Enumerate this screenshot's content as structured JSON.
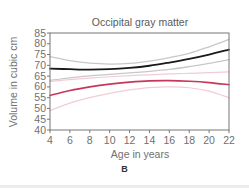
{
  "panel_label": "B",
  "chart_data": {
    "type": "line",
    "title": "Occipital gray matter",
    "xlabel": "Age in years",
    "ylabel": "Volume in cubic cm",
    "xlim": [
      4,
      22
    ],
    "ylim": [
      40,
      85
    ],
    "xticks": [
      4,
      6,
      8,
      10,
      12,
      14,
      16,
      18,
      20,
      22
    ],
    "yticks": [
      40,
      45,
      50,
      55,
      60,
      65,
      70,
      75,
      80,
      85
    ],
    "grid": false,
    "legend": null,
    "x": [
      4,
      6,
      8,
      10,
      12,
      14,
      16,
      18,
      20,
      22
    ],
    "series": [
      {
        "name": "Male mean",
        "color": "#1a1a1a",
        "width": 1.8,
        "values": [
          68.5,
          68.2,
          68.0,
          68.2,
          68.8,
          69.8,
          71.3,
          73.0,
          75.0,
          77.3
        ]
      },
      {
        "name": "Male upper CI",
        "color": "#c8c8c8",
        "width": 1.3,
        "values": [
          74.0,
          72.2,
          71.0,
          70.6,
          70.9,
          72.0,
          73.6,
          75.6,
          78.6,
          82.0
        ]
      },
      {
        "name": "Male lower CI",
        "color": "#c8c8c8",
        "width": 1.3,
        "values": [
          63.0,
          64.2,
          65.1,
          65.8,
          66.5,
          67.2,
          68.1,
          69.4,
          70.9,
          72.6
        ]
      },
      {
        "name": "Female mean",
        "color": "#c8375a",
        "width": 1.6,
        "values": [
          56.0,
          58.3,
          60.0,
          61.3,
          62.2,
          62.8,
          62.9,
          62.6,
          62.0,
          61.0
        ]
      },
      {
        "name": "Female upper CI",
        "color": "#f2ccd6",
        "width": 1.2,
        "values": [
          62.5,
          63.4,
          64.1,
          64.7,
          65.2,
          65.6,
          66.0,
          66.3,
          66.6,
          67.0
        ]
      },
      {
        "name": "Female lower CI",
        "color": "#f2ccd6",
        "width": 1.2,
        "values": [
          49.0,
          52.5,
          55.0,
          57.0,
          58.6,
          59.7,
          60.0,
          59.6,
          58.0,
          55.0
        ]
      }
    ]
  }
}
